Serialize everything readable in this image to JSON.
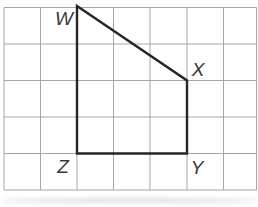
{
  "figure": {
    "width": 258,
    "height": 207,
    "background": "#ffffff",
    "grid": {
      "line_color": "#a6a6a6",
      "line_width": 1,
      "x_lines": [
        4,
        40.5,
        77,
        113.5,
        150,
        187,
        223.5,
        256.5
      ],
      "y_lines": [
        7.5,
        44,
        80.5,
        117,
        153.5,
        190
      ]
    },
    "shape": {
      "type": "quadrilateral",
      "name": "WXYZ",
      "stroke_color": "#262626",
      "stroke_width": 2.4,
      "fill": "none",
      "label_color": "#3b3b3b",
      "vertices": [
        {
          "label": "W",
          "x": 77,
          "y": 6,
          "label_x": 64,
          "label_y": 25
        },
        {
          "label": "X",
          "x": 187,
          "y": 80.5,
          "label_x": 198,
          "label_y": 76
        },
        {
          "label": "Y",
          "x": 187,
          "y": 153.5,
          "label_x": 197,
          "label_y": 174
        },
        {
          "label": "Z",
          "x": 77,
          "y": 153.5,
          "label_x": 63,
          "label_y": 173
        }
      ]
    },
    "scan_shadow_color": "#c4c4c4"
  }
}
